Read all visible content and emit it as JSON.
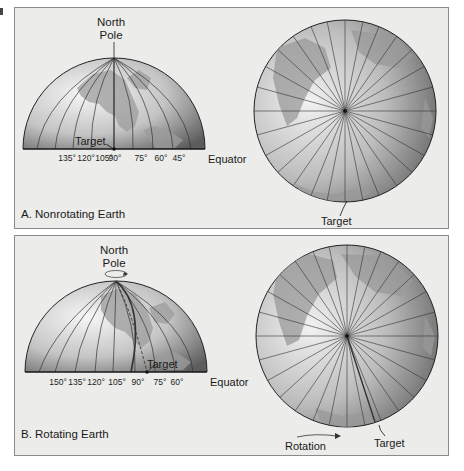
{
  "figure": {
    "panels": [
      {
        "id": "A",
        "caption": "A. Nonrotating Earth",
        "pole_label_line1": "North",
        "pole_label_line2": "Pole",
        "target_label": "Target",
        "equator_label": "Equator",
        "longitude_ticks": [
          "135°",
          "120°",
          "105°",
          "90°",
          "75°",
          "60°",
          "45°"
        ],
        "polar_view_target_label": "Target"
      },
      {
        "id": "B",
        "caption": "B. Rotating Earth",
        "pole_label_line1": "North",
        "pole_label_line2": "Pole",
        "target_label": "Target",
        "equator_label": "Equator",
        "longitude_ticks": [
          "150°",
          "135°",
          "120°",
          "105°",
          "90°",
          "75°",
          "60°"
        ],
        "polar_view_target_label": "Target",
        "rotation_label": "Rotation"
      }
    ],
    "colors": {
      "panel_bg": "#ececea",
      "panel_border": "#8a8a8a",
      "globe_light": "#f4f4f4",
      "globe_dark": "#6e6e6e",
      "land": "#9a9a9a",
      "grid_line": "#2a2a2a"
    }
  }
}
